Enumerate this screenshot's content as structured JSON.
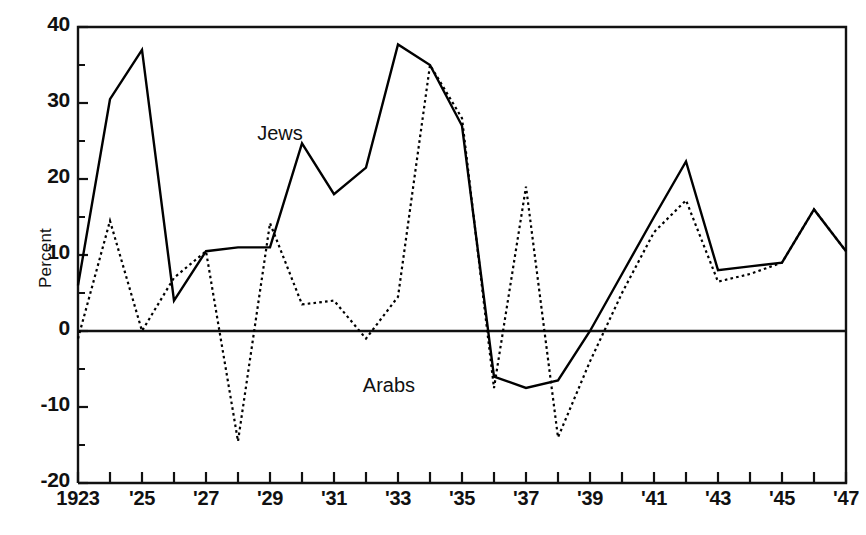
{
  "chart_data": {
    "type": "line",
    "title": "",
    "subtitle": "",
    "xlabel": "",
    "ylabel": "Percent",
    "xlim": [
      1923,
      1947
    ],
    "ylim": [
      -20,
      40
    ],
    "grid": false,
    "legend_position": "inline-annotation",
    "x": [
      1923,
      1924,
      1925,
      1926,
      1927,
      1928,
      1929,
      1930,
      1931,
      1932,
      1933,
      1934,
      1935,
      1936,
      1937,
      1938,
      1939,
      1940,
      1941,
      1942,
      1943,
      1944,
      1945,
      1946,
      1947
    ],
    "x_tick_labels": [
      "1923",
      "",
      "'25",
      "",
      "'27",
      "",
      "'29",
      "",
      "'31",
      "",
      "'33",
      "",
      "'35",
      "",
      "'37",
      "",
      "'39",
      "",
      "'41",
      "",
      "'43",
      "",
      "'45",
      "",
      "'47"
    ],
    "y_tick_labels": [
      "40",
      "30",
      "20",
      "10",
      "0",
      "-10",
      "-20"
    ],
    "y_ticks": [
      40,
      30,
      20,
      10,
      0,
      -10,
      -20
    ],
    "y_minor_ticks": [
      35,
      25,
      15,
      5,
      -5,
      -15
    ],
    "series": [
      {
        "name": "Jews",
        "style": "solid",
        "color": "#000000",
        "label_x": 1928.6,
        "label_y": 25.8,
        "values": [
          6,
          30.5,
          37,
          4,
          10.5,
          11,
          11,
          24.7,
          18,
          21.5,
          37.7,
          35,
          27,
          -6,
          -7.5,
          -6.5,
          0,
          7.5,
          15,
          22.3,
          8,
          8.5,
          9,
          16,
          10.5
        ]
      },
      {
        "name": "Arabs",
        "style": "dotted",
        "color": "#000000",
        "label_x": 1931.9,
        "label_y": -7.4,
        "values": [
          -1,
          14.5,
          0,
          7,
          10.5,
          -14.5,
          14.2,
          3.5,
          4,
          -1,
          4.5,
          35,
          28,
          -7.5,
          19,
          -14,
          -4,
          5,
          13,
          17.2,
          6.5,
          7.5,
          9,
          16,
          10.5
        ]
      }
    ],
    "annotations": [
      {
        "text": "Jews",
        "x": 1928.6,
        "y": 25.8
      },
      {
        "text": "Arabs",
        "x": 1931.9,
        "y": -7.4
      }
    ]
  },
  "axis": {
    "y_title": "Percent"
  }
}
